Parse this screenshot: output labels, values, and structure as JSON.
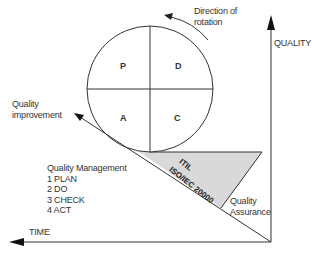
{
  "diagram": {
    "type": "pdca-quality-wheel",
    "quadrants": {
      "top_left": "P",
      "top_right": "D",
      "bottom_left": "A",
      "bottom_right": "C"
    },
    "rotation_label": "Direction of\nrotation",
    "rotation_label_line1": "Direction of",
    "rotation_label_line2": "rotation",
    "quality_improvement_line1": "Quality",
    "quality_improvement_line2": "improvement",
    "y_axis_label": "QUALITY",
    "x_axis_label": "TIME",
    "wedge_label_line1": "ITIL",
    "wedge_label_line2": "ISO/IEC 20000",
    "quality_assurance_line1": "Quality",
    "quality_assurance_line2": "Assurance",
    "quality_management": {
      "title": "Quality Management",
      "steps": [
        "1  PLAN",
        "2  DO",
        "3  CHECK",
        "4  ACT"
      ]
    },
    "colors": {
      "line": "#333333",
      "wedge_fill": "#d9d9d9",
      "background": "#ffffff"
    }
  }
}
